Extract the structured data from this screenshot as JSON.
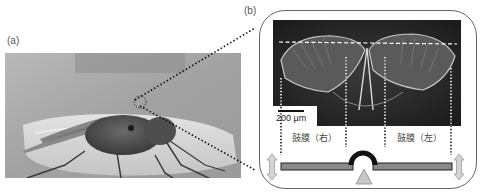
{
  "panels": {
    "a": {
      "label": "(a)",
      "description": "Photograph of a fly standing on a curved surface"
    },
    "b": {
      "label": "(b)",
      "description": "Micrograph of tympanal membranes with mechanical lever model"
    }
  },
  "micrograph": {
    "scale_bar_label": "200 µm"
  },
  "labels": {
    "tympanum_right": "鼓膜（右）",
    "tympanum_left": "鼓膜（左）"
  },
  "colors": {
    "box_border": "#666666",
    "beam_fill": "#8a8a8a",
    "beam_stroke": "#222222",
    "arch": "#111111",
    "pivot_fill": "#c8c8c8",
    "arrow_fill": "#d4d4d4",
    "dotted_line": "#111111"
  }
}
